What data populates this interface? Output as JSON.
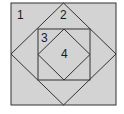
{
  "diagram": {
    "colors": {
      "fill": "#d3d3d3",
      "stroke": "#333333",
      "background": "#ffffff"
    },
    "shapes": {
      "outer_square": {
        "x1": 11,
        "y1": 3,
        "x2": 116,
        "y2": 105
      },
      "outer_diamond": {
        "top": [
          63.5,
          3
        ],
        "right": [
          116,
          54
        ],
        "bottom": [
          63.5,
          105
        ],
        "left": [
          11,
          54
        ]
      },
      "middle_square": {
        "x1": 38,
        "y1": 29,
        "x2": 90,
        "y2": 80
      },
      "inner_diamond": {
        "top": [
          64,
          29
        ],
        "right": [
          90,
          54.5
        ],
        "bottom": [
          64,
          80
        ],
        "left": [
          38,
          54.5
        ]
      }
    },
    "labels": [
      {
        "text": "1",
        "x": 20,
        "y": 19
      },
      {
        "text": "2",
        "x": 63,
        "y": 19
      },
      {
        "text": "3",
        "x": 44,
        "y": 42
      },
      {
        "text": "4",
        "x": 64,
        "y": 58
      }
    ]
  }
}
